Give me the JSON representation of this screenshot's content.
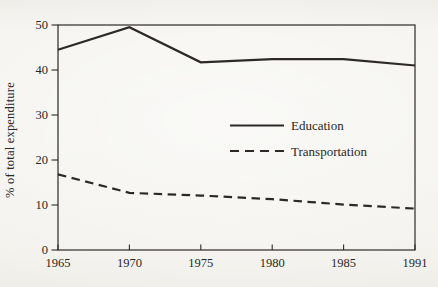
{
  "figure": {
    "paper_color": "#f3f2ed",
    "ink_color": "#2d2a26"
  },
  "chart_data": {
    "type": "line",
    "title": "",
    "xlabel": "",
    "ylabel": "% of total expenditure",
    "categories": [
      "1965",
      "1970",
      "1975",
      "1980",
      "1985",
      "1991"
    ],
    "ylim": [
      0,
      50
    ],
    "yticks": [
      0,
      10,
      20,
      30,
      40,
      50
    ],
    "grid": false,
    "legend_position": "center-right",
    "series": [
      {
        "name": "Education",
        "line_style": "solid",
        "values": [
          44.5,
          49.5,
          41.7,
          42.4,
          42.4,
          41.0
        ]
      },
      {
        "name": "Transportation",
        "line_style": "dashed",
        "values": [
          16.8,
          12.7,
          12.1,
          11.3,
          10.1,
          9.2
        ]
      }
    ]
  }
}
